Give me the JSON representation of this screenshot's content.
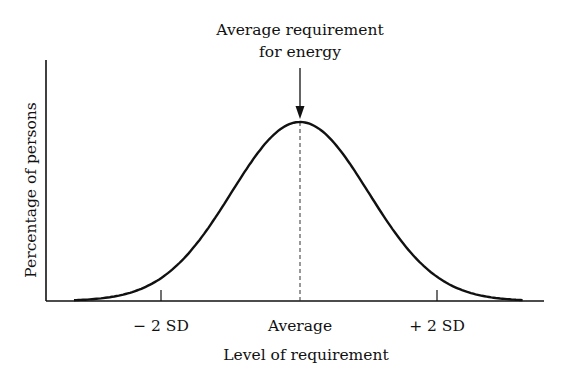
{
  "chart_data": {
    "type": "line",
    "title": "",
    "annotation": {
      "line1": "Average requirement",
      "line2": "for energy",
      "arrow_target": "Average"
    },
    "xlabel": "Level of requirement",
    "ylabel": "Percentage of persons",
    "x_ticks": [
      {
        "label": "− 2 SD",
        "value": -2
      },
      {
        "label": "Average",
        "value": 0
      },
      {
        "label": "+ 2 SD",
        "value": 2
      }
    ],
    "distribution": "normal",
    "mean": 0,
    "sd": 1,
    "x_range_sd": [
      -3.3,
      3.25
    ],
    "series": [
      {
        "name": "requirement distribution",
        "shape": "gaussian bell curve",
        "peak_at": 0
      }
    ],
    "reference_line": {
      "x": 0,
      "style": "dashed"
    },
    "grid": false,
    "legend": null
  },
  "colors": {
    "ink": "#111111",
    "background": "#ffffff"
  }
}
